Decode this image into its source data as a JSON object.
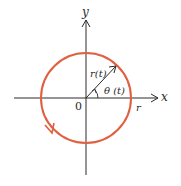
{
  "diagram": {
    "labels": {
      "y_axis": "y",
      "x_axis": "x",
      "radius": "r",
      "origin": "0",
      "position_vector": "r(t)",
      "angle": "θ (t)"
    },
    "colors": {
      "circle": "#e0603f",
      "axes": "#2a2a2a",
      "background": "#ffffff"
    },
    "geometry": {
      "center": [
        86,
        98
      ],
      "radius": 45,
      "vector_angle_deg": 40,
      "orientation": "counterclockwise"
    }
  }
}
